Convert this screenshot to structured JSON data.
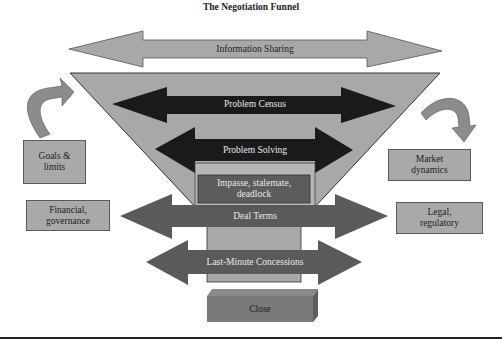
{
  "title": "The Negotiation Funnel",
  "funnel": {
    "stages": [
      {
        "id": "information-sharing",
        "label": "Information Sharing",
        "arrow": "double",
        "color": "#a8a8a8"
      },
      {
        "id": "problem-census",
        "label": "Problem Census",
        "arrow": "double",
        "color": "#1a1a1a"
      },
      {
        "id": "problem-solving",
        "label": "Problem Solving",
        "arrow": "double",
        "color": "#1a1a1a"
      },
      {
        "id": "impasse",
        "label_line1": "Impasse, stalemate,",
        "label_line2": "deadlock",
        "arrow": "none",
        "color": "#5c5c5c"
      },
      {
        "id": "deal-terms",
        "label": "Deal Terms",
        "arrow": "double",
        "color": "#5a5a5a"
      },
      {
        "id": "last-minute-concessions",
        "label": "Last-Minute Concessions",
        "arrow": "double",
        "color": "#5a5a5a"
      },
      {
        "id": "close",
        "label": "Close",
        "arrow": "none",
        "color": "#7a7a7a"
      }
    ],
    "funnel_color": "#a8a8a8"
  },
  "side_factors": {
    "left": [
      {
        "id": "goals-limits",
        "line1": "Goals &",
        "line2": "limits"
      },
      {
        "id": "financial-governance",
        "line1": "Financial,",
        "line2": "governance"
      }
    ],
    "right": [
      {
        "id": "market-dynamics",
        "line1": "Market",
        "line2": "dynamics"
      },
      {
        "id": "legal-regulatory",
        "line1": "Legal,",
        "line2": "regulatory"
      }
    ]
  }
}
